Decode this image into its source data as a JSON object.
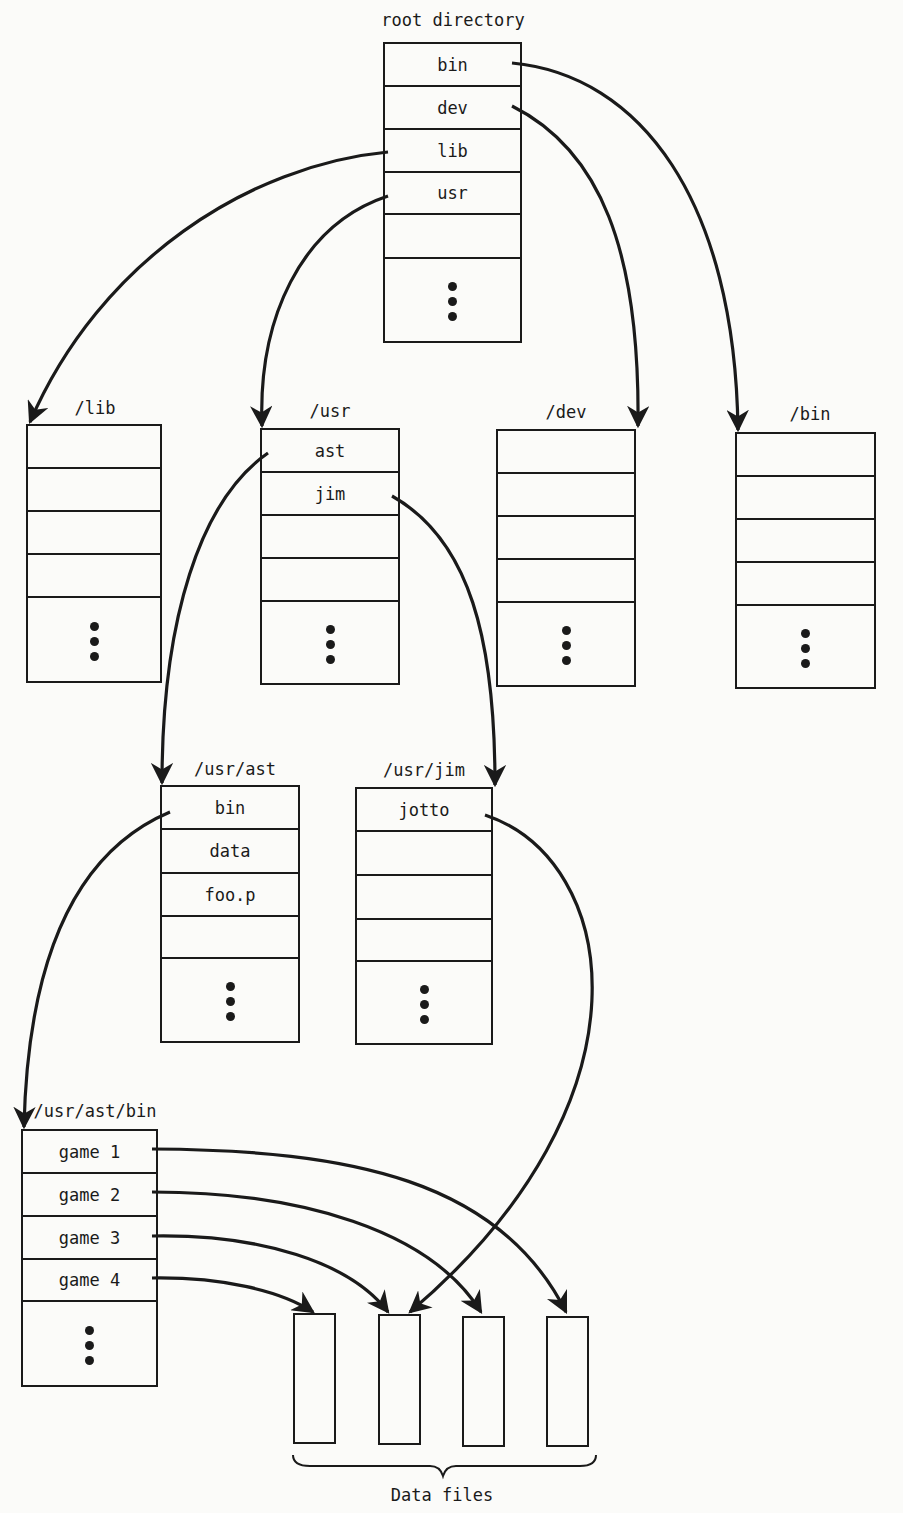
{
  "figure": {
    "caption": "Data files",
    "directories": [
      {
        "id": "root",
        "title": "root directory",
        "entries": [
          "bin",
          "dev",
          "lib",
          "usr",
          ""
        ],
        "more": true
      },
      {
        "id": "lib",
        "title": "/lib",
        "entries": [
          "",
          "",
          "",
          ""
        ],
        "more": true
      },
      {
        "id": "usr",
        "title": "/usr",
        "entries": [
          "ast",
          "jim",
          "",
          ""
        ],
        "more": true
      },
      {
        "id": "dev",
        "title": "/dev",
        "entries": [
          "",
          "",
          "",
          ""
        ],
        "more": true
      },
      {
        "id": "bin",
        "title": "/bin",
        "entries": [
          "",
          "",
          "",
          ""
        ],
        "more": true
      },
      {
        "id": "usr-ast",
        "title": "/usr/ast",
        "entries": [
          "bin",
          "data",
          "foo.p",
          ""
        ],
        "more": true
      },
      {
        "id": "usr-jim",
        "title": "/usr/jim",
        "entries": [
          "jotto",
          "",
          "",
          ""
        ],
        "more": true
      },
      {
        "id": "usr-ast-bin",
        "title": "/usr/ast/bin",
        "entries": [
          "game 1",
          "game 2",
          "game 3",
          "game 4"
        ],
        "more": true
      }
    ],
    "data_files": [
      "file-1",
      "file-2",
      "file-3",
      "file-4"
    ],
    "links": [
      {
        "from": "root/bin",
        "to": "/bin"
      },
      {
        "from": "root/dev",
        "to": "/dev"
      },
      {
        "from": "root/lib",
        "to": "/lib"
      },
      {
        "from": "root/usr",
        "to": "/usr"
      },
      {
        "from": "/usr/ast",
        "to": "/usr/ast"
      },
      {
        "from": "/usr/jim",
        "to": "/usr/jim"
      },
      {
        "from": "/usr/ast/bin",
        "to": "/usr/ast/bin"
      },
      {
        "from": "/usr/jim/jotto",
        "to": "file-2"
      },
      {
        "from": "game 1",
        "to": "file-4"
      },
      {
        "from": "game 2",
        "to": "file-3"
      },
      {
        "from": "game 3",
        "to": "file-2"
      },
      {
        "from": "game 4",
        "to": "file-1"
      }
    ]
  }
}
